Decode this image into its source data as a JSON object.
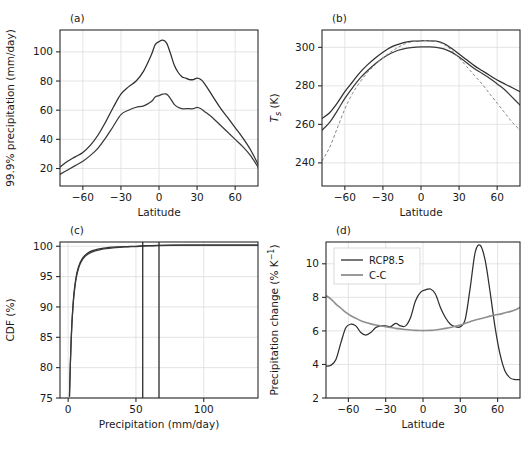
{
  "figure": {
    "width": 529,
    "height": 460,
    "background": "#ffffff",
    "colors": {
      "dark_line": "#2f2f2f",
      "gray_line": "#8f8f8f",
      "dashed_line": "#8a8a8a",
      "axis": "#2b2b2b",
      "grid": "#d9d9d9"
    }
  },
  "chart_data": [
    {
      "id": "panel-a",
      "type": "line",
      "panel_label": "(a)",
      "title": "",
      "xlabel": "Latitude",
      "ylabel": "99.9% precipitation (mm/day)",
      "xlim": [
        -78,
        78
      ],
      "ylim": [
        8,
        115
      ],
      "xticks": [
        -60,
        -30,
        0,
        30,
        60
      ],
      "xticklabels": [
        "−60",
        "−30",
        "0",
        "30",
        "60"
      ],
      "yticks": [
        20,
        40,
        60,
        80,
        100
      ],
      "yticklabels": [
        "20",
        "40",
        "60",
        "80",
        "100"
      ],
      "grid": true,
      "legend": "none",
      "x": [
        -78,
        -72,
        -66,
        -60,
        -54,
        -48,
        -42,
        -36,
        -30,
        -24,
        -18,
        -12,
        -6,
        -3,
        0,
        3,
        6,
        9,
        12,
        15,
        18,
        21,
        24,
        27,
        30,
        33,
        36,
        42,
        48,
        54,
        60,
        66,
        72,
        78
      ],
      "series": [
        {
          "name": "upper",
          "color": "#2f2f2f",
          "style": "solid",
          "values": [
            21,
            25,
            28,
            31,
            36,
            43,
            52,
            62,
            71,
            76,
            80,
            87,
            98,
            105,
            107,
            108,
            106,
            99,
            91,
            86,
            83,
            82,
            81,
            81,
            82,
            81,
            78,
            70,
            62,
            55,
            48,
            41,
            33,
            23
          ]
        },
        {
          "name": "lower",
          "color": "#3a3a3a",
          "style": "solid",
          "values": [
            16,
            19,
            22,
            25,
            29,
            34,
            41,
            49,
            57,
            60,
            62,
            63,
            66,
            69,
            70,
            71,
            71,
            68,
            64,
            62,
            61,
            61,
            61,
            61,
            62,
            61,
            59,
            55,
            50,
            45,
            40,
            35,
            29,
            21
          ]
        }
      ]
    },
    {
      "id": "panel-b",
      "type": "line",
      "panel_label": "(b)",
      "title": "",
      "xlabel": "Latitude",
      "ylabel": "T_s (K)",
      "ylabel_parts": {
        "main": "T",
        "sub": "s",
        "unit": " (K)"
      },
      "xlim": [
        -78,
        78
      ],
      "ylim": [
        228,
        309
      ],
      "xticks": [
        -60,
        -30,
        0,
        30,
        60
      ],
      "xticklabels": [
        "−60",
        "−30",
        "0",
        "30",
        "60"
      ],
      "yticks": [
        240,
        260,
        280,
        300
      ],
      "yticklabels": [
        "240",
        "260",
        "280",
        "300"
      ],
      "grid": true,
      "legend": "none",
      "x": [
        -78,
        -72,
        -66,
        -60,
        -54,
        -48,
        -42,
        -36,
        -30,
        -24,
        -18,
        -12,
        -6,
        0,
        6,
        12,
        18,
        24,
        30,
        36,
        42,
        48,
        54,
        60,
        66,
        72,
        78
      ],
      "series": [
        {
          "name": "solid-upper",
          "color": "#2f2f2f",
          "style": "solid",
          "values": [
            263,
            266,
            271,
            277,
            282,
            287,
            291,
            294.5,
            297.5,
            300,
            301.5,
            302.7,
            303.2,
            303.4,
            303.4,
            303.2,
            302,
            299.5,
            296.5,
            293.5,
            290.5,
            288,
            285.5,
            283,
            281,
            279,
            277
          ]
        },
        {
          "name": "solid-lower",
          "color": "#3a3a3a",
          "style": "solid",
          "values": [
            257,
            261,
            267,
            273.5,
            279,
            284,
            288,
            291.5,
            294.5,
            296.8,
            298.5,
            299.5,
            300,
            300.2,
            300.2,
            300,
            299.2,
            297.5,
            295,
            292,
            289,
            286.5,
            284,
            281,
            278,
            274,
            270
          ]
        },
        {
          "name": "dashed",
          "color": "#8a8a8a",
          "style": "dashed",
          "values": [
            241,
            248,
            258,
            268,
            276,
            282,
            287,
            291,
            294.5,
            297.5,
            300,
            302,
            303,
            303.4,
            303.4,
            303,
            301.5,
            298.5,
            294.5,
            290,
            285.5,
            281,
            276,
            271,
            266,
            261,
            257
          ]
        }
      ]
    },
    {
      "id": "panel-c",
      "type": "line",
      "panel_label": "(c)",
      "title": "",
      "xlabel": "Precipitation (mm/day)",
      "ylabel": "CDF (%)",
      "xlim": [
        -6,
        140
      ],
      "ylim": [
        75,
        100.7
      ],
      "xticks": [
        0,
        50,
        100
      ],
      "xticklabels": [
        "0",
        "50",
        "100"
      ],
      "yticks": [
        75,
        80,
        85,
        90,
        95,
        100
      ],
      "yticklabels": [
        "75",
        "80",
        "85",
        "90",
        "95",
        "100"
      ],
      "grid": true,
      "legend": "none",
      "x": [
        1.0,
        1.6,
        2.2,
        2.8,
        3.5,
        4.2,
        5.0,
        6.0,
        7.0,
        8.5,
        10,
        12,
        14,
        17,
        20,
        24,
        28,
        33,
        38,
        44,
        50,
        58,
        66,
        76,
        88,
        100,
        115,
        130,
        140
      ],
      "series": [
        {
          "name": "cdf-1",
          "color": "#2f2f2f",
          "style": "solid",
          "values": [
            75.3,
            80.5,
            84.5,
            87.5,
            90.0,
            92.0,
            93.6,
            95.1,
            96.1,
            97.1,
            97.8,
            98.4,
            98.8,
            99.2,
            99.4,
            99.6,
            99.75,
            99.85,
            99.9,
            99.95,
            100.0,
            100.1,
            100.15,
            100.18,
            100.2,
            100.2,
            100.2,
            100.2,
            100.2
          ]
        },
        {
          "name": "cdf-2",
          "color": "#6a6a6a",
          "style": "solid",
          "values": [
            75.3,
            80.3,
            84.2,
            87.2,
            89.7,
            91.7,
            93.3,
            94.8,
            95.8,
            96.9,
            97.6,
            98.2,
            98.6,
            99.0,
            99.25,
            99.45,
            99.62,
            99.75,
            99.83,
            99.9,
            99.95,
            100.05,
            100.12,
            100.16,
            100.18,
            100.2,
            100.2,
            100.2,
            100.2
          ]
        }
      ],
      "vertical_lines": [
        {
          "name": "vline-1",
          "x": 55
        },
        {
          "name": "vline-2",
          "x": 67
        }
      ]
    },
    {
      "id": "panel-d",
      "type": "line",
      "panel_label": "(d)",
      "title": "",
      "xlabel": "Latitude",
      "ylabel": "Precipitation change (% K⁻¹)",
      "ylabel_parts": {
        "main": "Precipitation change (% K",
        "sup": "−1",
        "tail": ")"
      },
      "xlim": [
        -78,
        78
      ],
      "ylim": [
        2,
        11.3
      ],
      "xticks": [
        -60,
        -30,
        0,
        30,
        60
      ],
      "xticklabels": [
        "−60",
        "−30",
        "0",
        "30",
        "60"
      ],
      "yticks": [
        2,
        4,
        6,
        8,
        10
      ],
      "yticklabels": [
        "2",
        "4",
        "6",
        "8",
        "10"
      ],
      "grid": true,
      "legend": "upper-left",
      "legend_entries": [
        {
          "label": "RCP8.5",
          "color": "#2f2f2f",
          "style": "solid"
        },
        {
          "label": "C-C",
          "color": "#8f8f8f",
          "style": "solid"
        }
      ],
      "x": [
        -78,
        -74,
        -70,
        -66,
        -62,
        -58,
        -54,
        -50,
        -46,
        -42,
        -38,
        -34,
        -30,
        -26,
        -22,
        -18,
        -14,
        -10,
        -6,
        -2,
        2,
        6,
        10,
        14,
        18,
        22,
        26,
        30,
        34,
        38,
        42,
        46,
        50,
        54,
        58,
        62,
        66,
        70,
        74,
        78
      ],
      "series": [
        {
          "name": "RCP8.5",
          "color": "#2f2f2f",
          "style": "solid",
          "values": [
            3.9,
            3.95,
            4.3,
            5.3,
            6.2,
            6.4,
            6.3,
            5.9,
            5.75,
            5.9,
            6.2,
            6.3,
            6.3,
            6.25,
            6.45,
            6.3,
            6.3,
            6.8,
            7.8,
            8.3,
            8.45,
            8.5,
            8.2,
            7.4,
            6.8,
            6.4,
            6.25,
            6.25,
            6.7,
            8.6,
            10.7,
            11.1,
            10.2,
            8.3,
            6.2,
            4.6,
            3.6,
            3.2,
            3.1,
            3.1
          ]
        },
        {
          "name": "C-C",
          "color": "#8f8f8f",
          "style": "solid",
          "values": [
            8.1,
            7.9,
            7.6,
            7.35,
            7.1,
            6.9,
            6.75,
            6.6,
            6.5,
            6.42,
            6.35,
            6.3,
            6.25,
            6.2,
            6.15,
            6.12,
            6.08,
            6.05,
            6.03,
            6.02,
            6.02,
            6.03,
            6.05,
            6.1,
            6.15,
            6.2,
            6.28,
            6.35,
            6.45,
            6.55,
            6.65,
            6.72,
            6.8,
            6.88,
            6.95,
            7.0,
            7.08,
            7.15,
            7.25,
            7.4
          ]
        }
      ]
    }
  ]
}
